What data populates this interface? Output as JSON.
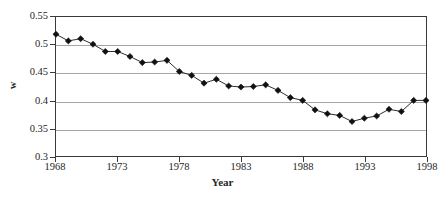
{
  "chart_data": {
    "type": "line",
    "title": "",
    "xlabel": "Year",
    "ylabel": "w",
    "x": [
      1968,
      1969,
      1970,
      1971,
      1972,
      1973,
      1974,
      1975,
      1976,
      1977,
      1978,
      1979,
      1980,
      1981,
      1982,
      1983,
      1984,
      1985,
      1986,
      1987,
      1988,
      1989,
      1990,
      1991,
      1992,
      1993,
      1994,
      1995,
      1996,
      1997,
      1998
    ],
    "values": [
      0.519,
      0.507,
      0.511,
      0.501,
      0.488,
      0.488,
      0.479,
      0.468,
      0.469,
      0.472,
      0.452,
      0.445,
      0.431,
      0.438,
      0.426,
      0.424,
      0.425,
      0.428,
      0.418,
      0.405,
      0.4,
      0.383,
      0.376,
      0.373,
      0.362,
      0.368,
      0.372,
      0.384,
      0.38,
      0.4,
      0.4
    ],
    "series": [
      {
        "name": "w",
        "values": [
          0.519,
          0.507,
          0.511,
          0.501,
          0.488,
          0.488,
          0.479,
          0.468,
          0.469,
          0.472,
          0.452,
          0.445,
          0.431,
          0.438,
          0.426,
          0.424,
          0.425,
          0.428,
          0.418,
          0.405,
          0.4,
          0.383,
          0.376,
          0.373,
          0.362,
          0.368,
          0.372,
          0.384,
          0.38,
          0.4,
          0.4
        ]
      }
    ],
    "xlim": [
      1968,
      1998
    ],
    "ylim": [
      0.3,
      0.55
    ],
    "xticks": [
      1968,
      1973,
      1978,
      1983,
      1988,
      1993,
      1998
    ],
    "xtick_labels": [
      "1968",
      "1973",
      "1978",
      "1983",
      "1988",
      "1993",
      "1998"
    ],
    "yticks": [
      0.3,
      0.35,
      0.4,
      0.45,
      0.5,
      0.55
    ],
    "ytick_labels": [
      "0.3",
      "0.35",
      "0.4",
      "0.45",
      "0.5",
      "0.55"
    ],
    "grid": "horizontal",
    "legend": "none",
    "marker": "diamond",
    "line_color": "#2b2b2b",
    "marker_color": "#111111",
    "grid_color": "#a6a6a6",
    "axis_color": "#3a3a3a",
    "background": "#ffffff"
  }
}
